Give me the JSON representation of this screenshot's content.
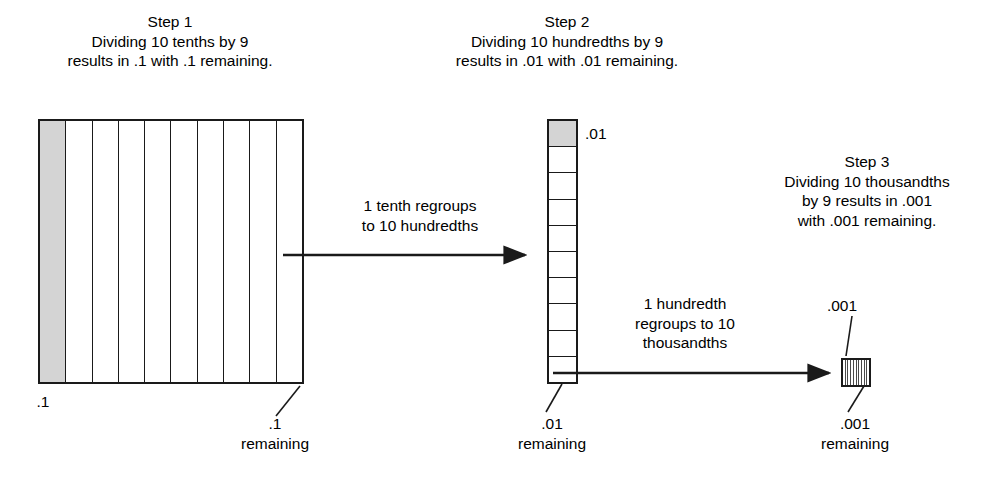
{
  "figure": {
    "background_color": "#ffffff",
    "line_color": "#1a1a1a",
    "shade_color": "#d4d4d4"
  },
  "steps": [
    {
      "id": "step1",
      "heading": "Step 1",
      "caption_line1": "Dividing 10 tenths by 9",
      "caption_line2": "results in .1 with .1 remaining.",
      "model": {
        "type": "unit-square-tenths",
        "divisions": 10,
        "shaded_count": 1,
        "shaded_position": "leftmost"
      },
      "label_left": ".1",
      "label_remaining_value": ".1",
      "label_remaining_word": "remaining"
    },
    {
      "id": "step2",
      "heading": "Step 2",
      "caption_line1": "Dividing 10 hundredths by 9",
      "caption_line2": "results in .01 with .01 remaining.",
      "model": {
        "type": "tenth-strip-hundredths",
        "divisions": 10,
        "shaded_count": 1,
        "shaded_position": "topmost"
      },
      "label_top": ".01",
      "label_remaining_value": ".01",
      "label_remaining_word": "remaining"
    },
    {
      "id": "step3",
      "heading": "Step 3",
      "caption_line1": "Dividing 10 thousandths",
      "caption_line2": "by 9 results in .001",
      "caption_line3": "with .001 remaining.",
      "model": {
        "type": "hundredth-square-thousandths",
        "divisions": 10,
        "shaded_count": 0
      },
      "label_top": ".001",
      "label_remaining_value": ".001",
      "label_remaining_word": "remaining"
    }
  ],
  "arrows": [
    {
      "id": "arrow1",
      "from": "step1",
      "to": "step2",
      "label_line1": "1 tenth regroups",
      "label_line2": "to 10 hundredths"
    },
    {
      "id": "arrow2",
      "from": "step2",
      "to": "step3",
      "label_line1": "1 hundredth",
      "label_line2": "regroups to 10",
      "label_line3": "thousandths"
    }
  ]
}
